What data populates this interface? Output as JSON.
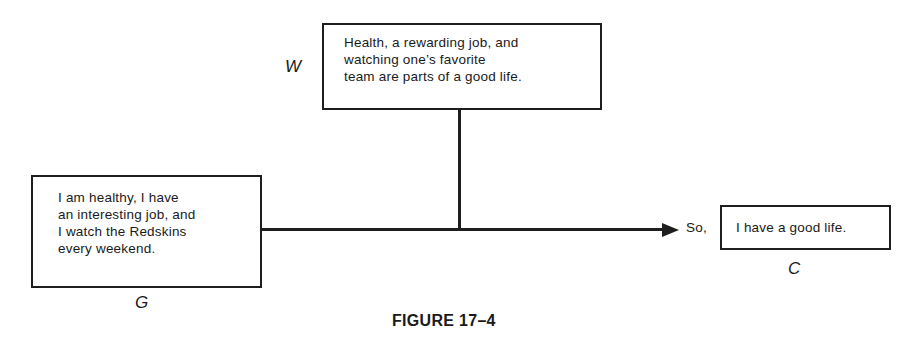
{
  "diagram": {
    "warrant": {
      "label": "W",
      "text": "Health, a rewarding job, and\nwatching one’s favorite\nteam are parts of a good life."
    },
    "grounds": {
      "label": "G",
      "text": "I am healthy, I have\nan interesting job, and\nI watch the Redskins\nevery weekend."
    },
    "claim": {
      "label": "C",
      "connector": "So,",
      "text": "I have a good life."
    },
    "caption": "FIGURE 17–4"
  }
}
